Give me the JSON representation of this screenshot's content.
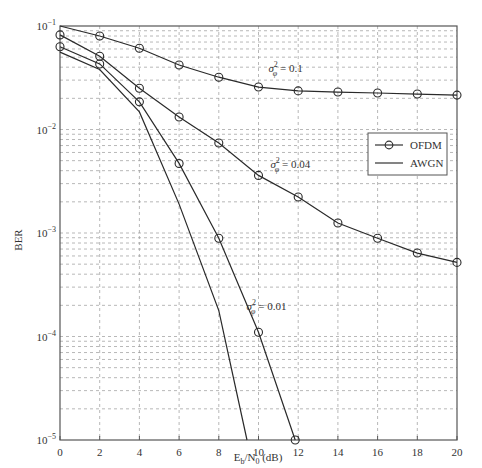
{
  "chart_data": {
    "type": "line",
    "title": "",
    "xlabel": "E_b/N_0 (dB)",
    "ylabel": "BER",
    "xlim": [
      0,
      20
    ],
    "ylim": [
      1e-05,
      0.1
    ],
    "yscale": "log",
    "grid": true,
    "x_ticks": [
      0,
      2,
      4,
      6,
      8,
      10,
      12,
      14,
      16,
      18,
      20
    ],
    "y_ticks": [
      {
        "value": 0.1,
        "mantissa": "10",
        "exp": "−1"
      },
      {
        "value": 0.01,
        "mantissa": "10",
        "exp": "−2"
      },
      {
        "value": 0.001,
        "mantissa": "10",
        "exp": "−3"
      },
      {
        "value": 0.0001,
        "mantissa": "10",
        "exp": "−4"
      },
      {
        "value": 1e-05,
        "mantissa": "10",
        "exp": "−5"
      }
    ],
    "legend": {
      "position": "right-middle",
      "entries": [
        {
          "label": "OFDM",
          "marker": "circle"
        },
        {
          "label": "AWGN",
          "marker": "none"
        }
      ]
    },
    "series": [
      {
        "name": "OFDM σφ² = 0.1",
        "group": "OFDM",
        "marker": "circle",
        "points": [
          [
            0,
            0.1
          ],
          [
            2,
            0.08
          ],
          [
            4,
            0.061
          ],
          [
            6,
            0.042
          ],
          [
            8,
            0.032
          ],
          [
            10,
            0.0257
          ],
          [
            12,
            0.0236
          ],
          [
            14,
            0.023
          ],
          [
            16,
            0.0225
          ],
          [
            18,
            0.022
          ],
          [
            20,
            0.0215
          ]
        ],
        "marker_from_index": 1
      },
      {
        "name": "OFDM σφ² = 0.04",
        "group": "OFDM",
        "marker": "circle",
        "points": [
          [
            0,
            0.082
          ],
          [
            2,
            0.051
          ],
          [
            4,
            0.025
          ],
          [
            6,
            0.0132
          ],
          [
            8,
            0.0074
          ],
          [
            10,
            0.0036
          ],
          [
            12,
            0.00223
          ],
          [
            14,
            0.00125
          ],
          [
            16,
            0.00089
          ],
          [
            18,
            0.00064
          ],
          [
            20,
            0.00052
          ]
        ],
        "marker_from_index": 0
      },
      {
        "name": "OFDM σφ² = 0.01",
        "group": "OFDM",
        "marker": "circle",
        "points": [
          [
            0,
            0.063
          ],
          [
            2,
            0.043
          ],
          [
            4,
            0.0185
          ],
          [
            6,
            0.0047
          ],
          [
            8,
            0.00089
          ],
          [
            10,
            0.00011
          ],
          [
            11.85,
            1e-05
          ]
        ],
        "marker_from_index": 0
      },
      {
        "name": "AWGN",
        "group": "AWGN",
        "marker": "none",
        "points": [
          [
            0,
            0.056
          ],
          [
            2,
            0.038
          ],
          [
            4,
            0.0148
          ],
          [
            6,
            0.0019
          ],
          [
            8,
            0.000178
          ],
          [
            9.42,
            1e-05
          ]
        ]
      }
    ],
    "annotations": [
      {
        "text_sigma": "σ",
        "sup": "2",
        "sub": "φ",
        "text_rest": " = 0.1",
        "x": 10.5,
        "y": 0.036
      },
      {
        "text_sigma": "σ",
        "sup": "2",
        "sub": "φ",
        "text_rest": " = 0.04",
        "x": 10.6,
        "y": 0.0042
      },
      {
        "text_sigma": "σ",
        "sup": "2",
        "sub": "φ",
        "text_rest": " = 0.01",
        "x": 9.4,
        "y": 0.00018
      }
    ]
  },
  "legend_labels": {
    "ofdm": "OFDM",
    "awgn": "AWGN"
  },
  "axis": {
    "ylabel": "BER",
    "xlabel_main": "E",
    "xlabel_sub1": "b",
    "xlabel_mid": "/N",
    "xlabel_sub2": "0",
    "xlabel_tail": " (dB)"
  }
}
